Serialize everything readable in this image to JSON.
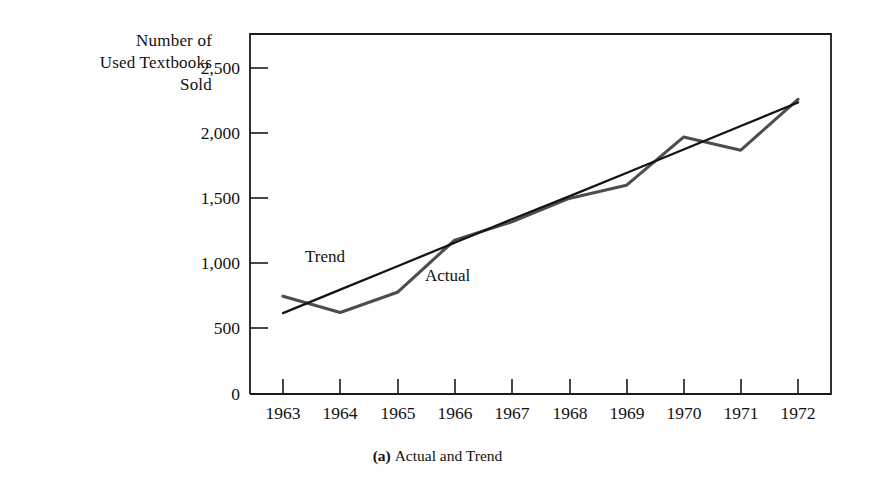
{
  "figure": {
    "caption_index": "(a)",
    "caption_text": "Actual and Trend"
  },
  "axis_title": {
    "line1": "Number of",
    "line2": "Used Textbooks",
    "line3": "Sold"
  },
  "annotations": {
    "trend": "Trend",
    "actual": "Actual"
  },
  "colors": {
    "frame": "#1a1a1a",
    "actual_line": "#4d4d4d",
    "trend_line": "#141414",
    "text": "#111111",
    "background": "#ffffff"
  },
  "chart_data": {
    "type": "line",
    "xlabel": "",
    "ylabel": "Number of Used Textbooks Sold",
    "x": [
      1963,
      1964,
      1965,
      1966,
      1967,
      1968,
      1969,
      1970,
      1971,
      1972
    ],
    "categories": [
      "1963",
      "1964",
      "1965",
      "1966",
      "1967",
      "1968",
      "1969",
      "1970",
      "1971",
      "1972"
    ],
    "xtick_labels": [
      "1963",
      "1964",
      "1965",
      "1966",
      "1967",
      "1968",
      "1969",
      "1970",
      "1971",
      "1972"
    ],
    "ytick_labels": [
      "0",
      "500",
      "1,000",
      "1,500",
      "2,000",
      "2,500"
    ],
    "ytick_values": [
      0,
      500,
      1000,
      1500,
      2000,
      2500
    ],
    "ylim": [
      0,
      2680
    ],
    "xlim": [
      1962.65,
      1973.25
    ],
    "grid": false,
    "legend": "inline-annotations",
    "series": [
      {
        "name": "Actual",
        "values": [
          750,
          625,
          780,
          1180,
          1320,
          1500,
          1600,
          1970,
          1870,
          2260
        ]
      },
      {
        "name": "Trend",
        "values": [
          620,
          800,
          980,
          1160,
          1340,
          1515,
          1695,
          1875,
          2055,
          2235
        ]
      }
    ]
  }
}
